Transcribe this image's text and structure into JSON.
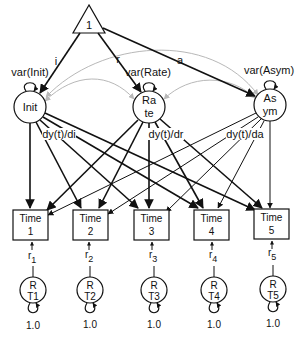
{
  "diagram": {
    "type": "structural-equation-model path diagram",
    "constant": {
      "label": "1"
    },
    "latent_factors": [
      {
        "id": "init",
        "label_line1": "Init",
        "label_line2": "",
        "variance_label": "var(Init)",
        "path_from_constant": "i",
        "loading_label": "dy(t)/di"
      },
      {
        "id": "rate",
        "label_line1": "Ra",
        "label_line2": "te",
        "variance_label": "var(Rate)",
        "path_from_constant": "r",
        "loading_label": "dy(t)/dr"
      },
      {
        "id": "asym",
        "label_line1": "As",
        "label_line2": "ym",
        "variance_label": "var(Asym)",
        "path_from_constant": "a",
        "loading_label": "dy(t)/da"
      }
    ],
    "observed": [
      {
        "label_line1": "Time",
        "label_line2": "1"
      },
      {
        "label_line1": "Time",
        "label_line2": "2"
      },
      {
        "label_line1": "Time",
        "label_line2": "3"
      },
      {
        "label_line1": "Time",
        "label_line2": "4"
      },
      {
        "label_line1": "Time",
        "label_line2": "5"
      }
    ],
    "residual_paths": [
      {
        "label": "r",
        "sub": "1"
      },
      {
        "label": "r",
        "sub": "2"
      },
      {
        "label": "r",
        "sub": "3"
      },
      {
        "label": "r",
        "sub": "4"
      },
      {
        "label": "r",
        "sub": "5"
      }
    ],
    "residuals": [
      {
        "label_line1": "R",
        "label_line2": "T1",
        "variance": "1.0"
      },
      {
        "label_line1": "R",
        "label_line2": "T2",
        "variance": "1.0"
      },
      {
        "label_line1": "R",
        "label_line2": "T3",
        "variance": "1.0"
      },
      {
        "label_line1": "R",
        "label_line2": "T4",
        "variance": "1.0"
      },
      {
        "label_line1": "R",
        "label_line2": "T5",
        "variance": "1.0"
      }
    ],
    "colors": {
      "path": "#111111",
      "covariance": "#b8b8b8",
      "background": "#ffffff"
    }
  }
}
